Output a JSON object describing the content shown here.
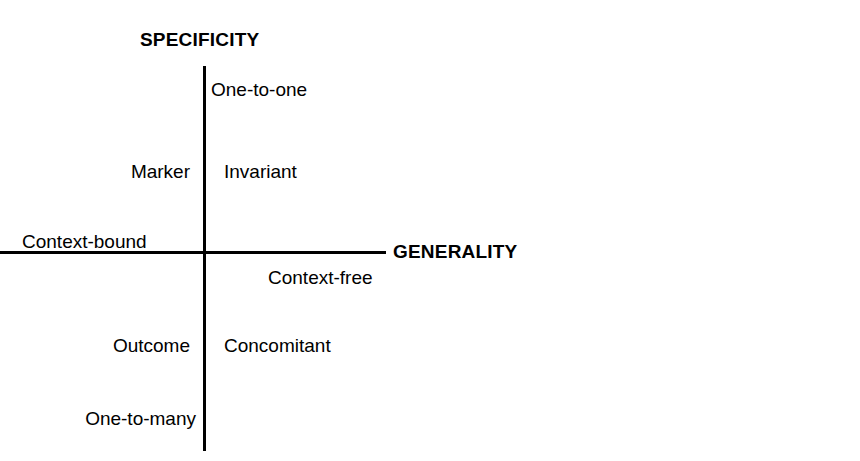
{
  "chart_data": {
    "type": "diagram",
    "subtype": "quadrant",
    "title": "",
    "axes": {
      "vertical": {
        "title": "SPECIFICITY",
        "title_position": "top",
        "style": "bold"
      },
      "horizontal": {
        "title": "GENERALITY",
        "title_position": "right",
        "style": "bold"
      }
    },
    "axis_endpoint_labels": [
      {
        "text": "Context-bound",
        "side": "left",
        "relation": "above-axis"
      },
      {
        "text": "Context-free",
        "side": "right",
        "relation": "below-axis"
      },
      {
        "text": "One-to-one",
        "side": "top",
        "relation": "right-of-axis"
      },
      {
        "text": "One-to-many",
        "side": "bottom",
        "relation": "left-of-axis"
      }
    ],
    "quadrant_labels": [
      {
        "text": "Marker",
        "quadrant": "upper-left"
      },
      {
        "text": "Invariant",
        "quadrant": "upper-right"
      },
      {
        "text": "Outcome",
        "quadrant": "lower-left"
      },
      {
        "text": "Concomitant",
        "quadrant": "lower-right"
      }
    ],
    "colors": {
      "line": "#000000",
      "text": "#000000",
      "background": "#ffffff"
    }
  },
  "diagram": {
    "axis_titles": {
      "vertical": "SPECIFICITY",
      "horizontal": "GENERALITY"
    },
    "labels": {
      "one_to_one": "One-to-one",
      "marker": "Marker",
      "invariant": "Invariant",
      "context_bound": "Context-bound",
      "context_free": "Context-free",
      "outcome": "Outcome",
      "concomitant": "Concomitant",
      "one_to_many": "One-to-many"
    }
  }
}
